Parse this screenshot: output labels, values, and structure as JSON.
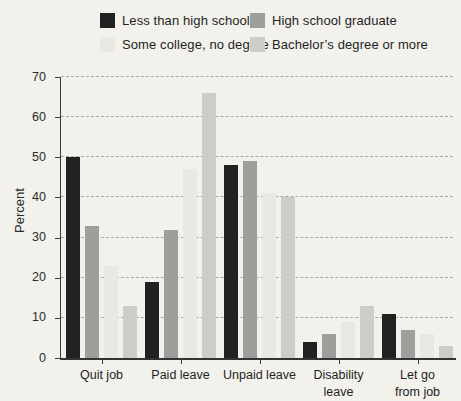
{
  "chart_data": {
    "type": "bar",
    "title": "",
    "xlabel": "",
    "ylabel": "Percent",
    "ylim": [
      0,
      70
    ],
    "yticks": [
      0,
      10,
      20,
      30,
      40,
      50,
      60,
      70
    ],
    "grid": "horizontal dashed",
    "legend_position": "top",
    "categories": [
      "Quit job",
      "Paid leave",
      "Unpaid leave",
      "Disability leave",
      "Let go from job"
    ],
    "tick_labels": [
      "Quit job",
      "Paid leave",
      "Unpaid leave",
      "Disability\nleave",
      "Let go\nfrom job"
    ],
    "series": [
      {
        "name": "Less than high school",
        "color": "#212121",
        "values": [
          50,
          19,
          48,
          4,
          11
        ]
      },
      {
        "name": "High school graduate",
        "color": "#9e9e9c",
        "values": [
          33,
          32,
          49,
          6,
          7
        ]
      },
      {
        "name": "Some college, no degree",
        "color": "#eae8e2",
        "values": [
          23,
          47,
          41,
          9,
          6
        ]
      },
      {
        "name": "Bachelor’s degree or more",
        "color": "#cdccc7",
        "values": [
          13,
          66,
          40,
          13,
          3
        ]
      }
    ]
  },
  "colors": {
    "background": "#f2f1ec",
    "axis": "#3a3a3a",
    "gridline": "#a8a7a0",
    "text": "#1f1f1f"
  }
}
